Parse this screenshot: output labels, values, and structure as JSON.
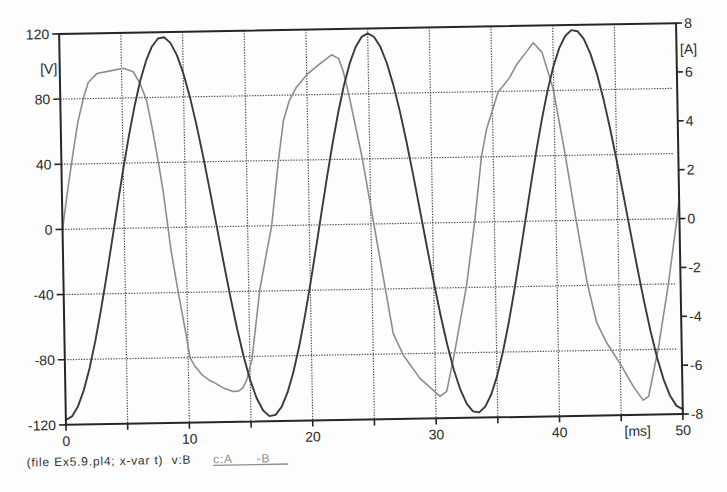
{
  "chart_data": {
    "type": "line",
    "title": "",
    "xlabel": "[ms]",
    "ylabel": "[V]",
    "ylabel_right": "[A]",
    "grid": true,
    "legend_position": "bottom-left",
    "x_axis": {
      "min": 0,
      "max": 50,
      "grid_step": 5,
      "tick_step": 5,
      "unit": "[ms]",
      "labels": [
        {
          "value": 0,
          "text": "0"
        },
        {
          "value": 10,
          "text": "10"
        },
        {
          "value": 20,
          "text": "20"
        },
        {
          "value": 30,
          "text": "30"
        },
        {
          "value": 40,
          "text": "40"
        },
        {
          "value": 45,
          "text": "[ms]",
          "anchor": "start"
        },
        {
          "value": 50,
          "text": "50"
        }
      ]
    },
    "y_left_axis": {
      "min": -120,
      "max": 120,
      "unit": "[V]",
      "ticks": [
        120,
        80,
        40,
        0,
        -40,
        -80,
        -120
      ],
      "tick_labels": [
        "120",
        "80",
        "40",
        "0",
        "-40",
        "-80",
        "-120"
      ],
      "grid_values": [
        80,
        40,
        0,
        -40,
        -80
      ]
    },
    "y_right_axis": {
      "min": -8,
      "max": 8,
      "unit": "[A]",
      "ticks": [
        8,
        6,
        4,
        2,
        0,
        -2,
        -4,
        -6,
        -8
      ],
      "tick_labels": [
        "8",
        "6",
        "4",
        "2",
        "0",
        "-2",
        "-4",
        "-6",
        "-8"
      ]
    },
    "series": [
      {
        "name": "c:A -B",
        "quantity": "current",
        "unit": "A",
        "axis": "right",
        "color": "#8d8d8d",
        "line_width": 1.6,
        "points": [
          [
            0,
            0.0
          ],
          [
            0.5,
            1.7
          ],
          [
            1.0,
            3.25
          ],
          [
            1.4,
            4.4
          ],
          [
            1.9,
            5.4
          ],
          [
            2.3,
            6.0
          ],
          [
            3.0,
            6.35
          ],
          [
            4.1,
            6.45
          ],
          [
            5.15,
            6.55
          ],
          [
            5.95,
            6.4
          ],
          [
            6.5,
            5.9
          ],
          [
            7.0,
            5.2
          ],
          [
            7.4,
            4.1
          ],
          [
            7.85,
            2.7
          ],
          [
            8.2,
            1.5
          ],
          [
            8.5,
            0.2
          ],
          [
            8.75,
            -0.9
          ],
          [
            9.3,
            -2.7
          ],
          [
            9.8,
            -4.2
          ],
          [
            10.15,
            -5.35
          ],
          [
            10.55,
            -5.7
          ],
          [
            11.1,
            -6.05
          ],
          [
            11.75,
            -6.3
          ],
          [
            12.15,
            -6.4
          ],
          [
            12.8,
            -6.6
          ],
          [
            13.6,
            -6.75
          ],
          [
            14.0,
            -6.75
          ],
          [
            14.4,
            -6.6
          ],
          [
            14.7,
            -6.3
          ],
          [
            15.0,
            -5.75
          ],
          [
            15.15,
            -5.5
          ],
          [
            15.9,
            -2.6
          ],
          [
            16.5,
            -1.1
          ],
          [
            16.95,
            0.0
          ],
          [
            17.6,
            2.7
          ],
          [
            18.05,
            4.3
          ],
          [
            18.55,
            5.1
          ],
          [
            19.15,
            5.65
          ],
          [
            20.1,
            6.2
          ],
          [
            21.1,
            6.6
          ],
          [
            22.05,
            6.95
          ],
          [
            22.6,
            6.8
          ],
          [
            22.95,
            6.3
          ],
          [
            23.35,
            5.4
          ],
          [
            24.35,
            2.8
          ],
          [
            25.2,
            0.1
          ],
          [
            26.05,
            -2.6
          ],
          [
            26.65,
            -4.5
          ],
          [
            27.45,
            -5.4
          ],
          [
            28.75,
            -6.35
          ],
          [
            30.35,
            -7.1
          ],
          [
            30.9,
            -6.9
          ],
          [
            31.6,
            -5.3
          ],
          [
            32.65,
            -2.6
          ],
          [
            33.4,
            0.0
          ],
          [
            34.05,
            2.7
          ],
          [
            34.5,
            3.8
          ],
          [
            35.5,
            5.33
          ],
          [
            35.9,
            5.55
          ],
          [
            36.45,
            5.9
          ],
          [
            37.0,
            6.4
          ],
          [
            37.7,
            6.85
          ],
          [
            38.4,
            7.3
          ],
          [
            39.1,
            6.9
          ],
          [
            39.95,
            5.4
          ],
          [
            40.8,
            2.8
          ],
          [
            41.6,
            0.1
          ],
          [
            42.45,
            -2.6
          ],
          [
            43.15,
            -4.2
          ],
          [
            43.95,
            -5.05
          ],
          [
            45.0,
            -5.9
          ],
          [
            46.05,
            -6.85
          ],
          [
            46.8,
            -7.4
          ],
          [
            47.25,
            -7.25
          ],
          [
            48.1,
            -5.3
          ],
          [
            49.0,
            -2.7
          ],
          [
            49.8,
            0.0
          ],
          [
            50.0,
            0.75
          ]
        ]
      },
      {
        "name": "v:B",
        "quantity": "voltage",
        "unit": "V",
        "axis": "left",
        "color": "#3a3a3a",
        "line_width": 1.9,
        "points": [
          [
            0,
            -117.0
          ],
          [
            0.5,
            -114.9
          ],
          [
            1,
            -108.8
          ],
          [
            1.5,
            -98.8
          ],
          [
            2,
            -85.3
          ],
          [
            2.5,
            -68.8
          ],
          [
            3,
            -49.8
          ],
          [
            3.5,
            -29.1
          ],
          [
            4,
            -7.3
          ],
          [
            4.5,
            14.7
          ],
          [
            5,
            36.2
          ],
          [
            5.5,
            56.4
          ],
          [
            6,
            74.6
          ],
          [
            6.5,
            90.2
          ],
          [
            7,
            102.5
          ],
          [
            7.5,
            111.3
          ],
          [
            8,
            116.1
          ],
          [
            8.5,
            116.8
          ],
          [
            9,
            113.3
          ],
          [
            9.5,
            105.9
          ],
          [
            10,
            94.7
          ],
          [
            10.5,
            80.1
          ],
          [
            11,
            62.7
          ],
          [
            11.5,
            43.1
          ],
          [
            12,
            21.9
          ],
          [
            12.5,
            0.0
          ],
          [
            13,
            -21.9
          ],
          [
            13.5,
            -43.1
          ],
          [
            14,
            -62.7
          ],
          [
            14.5,
            -80.1
          ],
          [
            15,
            -94.7
          ],
          [
            15.5,
            -105.9
          ],
          [
            16,
            -113.3
          ],
          [
            16.5,
            -116.8
          ],
          [
            17,
            -116.1
          ],
          [
            17.5,
            -111.3
          ],
          [
            18,
            -102.5
          ],
          [
            18.5,
            -90.2
          ],
          [
            19,
            -74.6
          ],
          [
            19.5,
            -56.4
          ],
          [
            20,
            -36.2
          ],
          [
            20.5,
            -14.7
          ],
          [
            21,
            7.3
          ],
          [
            21.5,
            29.1
          ],
          [
            22,
            49.8
          ],
          [
            22.5,
            68.8
          ],
          [
            23,
            85.3
          ],
          [
            23.5,
            98.8
          ],
          [
            24,
            108.8
          ],
          [
            24.5,
            114.9
          ],
          [
            25,
            117.0
          ],
          [
            25.5,
            114.9
          ],
          [
            26,
            108.8
          ],
          [
            26.5,
            98.8
          ],
          [
            27,
            85.3
          ],
          [
            27.5,
            68.8
          ],
          [
            28,
            49.8
          ],
          [
            28.5,
            29.1
          ],
          [
            29,
            7.3
          ],
          [
            29.5,
            -14.7
          ],
          [
            30,
            -36.2
          ],
          [
            30.5,
            -56.4
          ],
          [
            31,
            -74.6
          ],
          [
            31.5,
            -90.2
          ],
          [
            32,
            -102.5
          ],
          [
            32.5,
            -111.3
          ],
          [
            33,
            -116.1
          ],
          [
            33.5,
            -116.8
          ],
          [
            34,
            -113.3
          ],
          [
            34.5,
            -105.9
          ],
          [
            35,
            -94.7
          ],
          [
            35.5,
            -80.1
          ],
          [
            36,
            -62.7
          ],
          [
            36.5,
            -43.1
          ],
          [
            37,
            -21.9
          ],
          [
            37.5,
            0.0
          ],
          [
            38,
            21.9
          ],
          [
            38.5,
            43.1
          ],
          [
            39,
            62.7
          ],
          [
            39.5,
            80.1
          ],
          [
            40,
            94.7
          ],
          [
            40.5,
            105.9
          ],
          [
            41,
            113.3
          ],
          [
            41.5,
            116.8
          ],
          [
            42,
            116.1
          ],
          [
            42.5,
            111.3
          ],
          [
            43,
            102.5
          ],
          [
            43.5,
            90.2
          ],
          [
            44,
            74.6
          ],
          [
            44.5,
            56.4
          ],
          [
            45,
            36.2
          ],
          [
            45.5,
            14.7
          ],
          [
            46,
            -7.3
          ],
          [
            46.5,
            -29.1
          ],
          [
            47,
            -49.8
          ],
          [
            47.5,
            -68.8
          ],
          [
            48,
            -85.3
          ],
          [
            48.5,
            -98.8
          ],
          [
            49,
            -108.8
          ],
          [
            49.5,
            -114.9
          ],
          [
            50,
            -117.0
          ]
        ]
      }
    ]
  },
  "legend": {
    "file_info": "(file Ex5.9.pl4; x-var t)",
    "items": [
      {
        "label": "v:B",
        "color": "#333333",
        "underlined": false
      },
      {
        "label": "c:A",
        "label_suffix": "-B",
        "color": "#8d8d8d",
        "underlined": true
      }
    ]
  },
  "colors": {
    "background": "#fdfdfd",
    "frame": "#262626",
    "grid": "#4a4a4a",
    "text": "#2b2b2b"
  }
}
